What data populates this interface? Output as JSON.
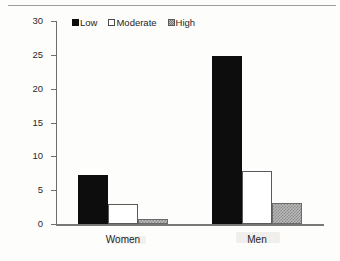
{
  "chart_data": {
    "type": "bar",
    "title": "",
    "xlabel": "",
    "ylabel": "CVD Deaths per 10,000 person-years",
    "ylim": [
      0,
      30
    ],
    "yticks": [
      0,
      5,
      10,
      15,
      20,
      25,
      30
    ],
    "ytick_labels": [
      "0",
      "5",
      "10",
      "15",
      "20",
      "25",
      "30"
    ],
    "grid": false,
    "legend_position": "top-center",
    "categories": [
      "Women",
      "Men"
    ],
    "series": [
      {
        "name": "Low",
        "values": [
          7.3,
          24.8
        ]
      },
      {
        "name": "Moderate",
        "values": [
          2.9,
          7.9
        ]
      },
      {
        "name": "High",
        "values": [
          0.8,
          3.1
        ]
      }
    ]
  },
  "legend": {
    "items": [
      {
        "label": "Low",
        "swatch": "solid-black-swatch"
      },
      {
        "label": "Moderate",
        "swatch": "open-white-swatch"
      },
      {
        "label": "High",
        "swatch": "hatched-gray-swatch"
      }
    ]
  },
  "colors": {
    "low": "#0d0d0d",
    "moderate": "#ffffff",
    "high": "#b9b9b9",
    "axis": "#6e6e6e",
    "text": "#1f1f1f",
    "background": "#fdfdfc"
  }
}
